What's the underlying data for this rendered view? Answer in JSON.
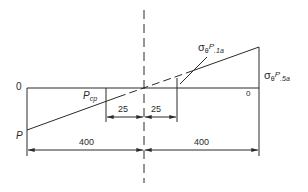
{
  "diagram": {
    "line_color": "#2a2a2a",
    "labels": {
      "zero_left": "0",
      "zero_right": "0",
      "p": "P",
      "pcp_main": "P",
      "pcp_sub": "cp",
      "sigma1_main": "σ",
      "sigma1_theta": "θ",
      "sigma1_p": "P",
      "sigma1_sub": ".1a",
      "sigma5_main": "σ",
      "sigma5_theta": "θ",
      "sigma5_p": "P",
      "sigma5_sub": ".5a"
    },
    "dimensions": {
      "inner_left": "25",
      "inner_right": "25",
      "outer_left": "400",
      "outer_right": "400"
    }
  }
}
